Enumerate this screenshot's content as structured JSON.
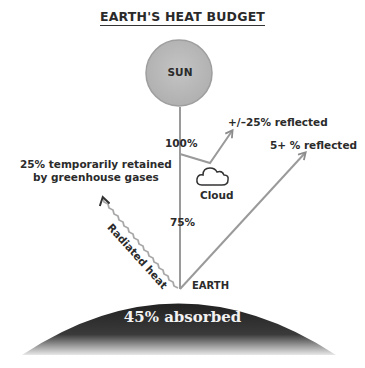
{
  "title": "EARTH'S HEAT BUDGET",
  "sun": {
    "label": "SUN",
    "color": "#bdbdbd"
  },
  "earth": {
    "label": "EARTH",
    "absorbed_label": "45% absorbed",
    "color": "#2e2e2e"
  },
  "cloud": {
    "label": "Cloud"
  },
  "rays": {
    "incoming_label": "100%",
    "after_cloud_label": "75%",
    "cloud_reflected_label": "+/–25% reflected",
    "surface_reflected_label": "5+ % reflected",
    "radiated_label": "Radiated heat",
    "retained_label_line1": "25% temporarily retained",
    "retained_label_line2": "by greenhouse gases",
    "line_color": "#9a9a9a"
  }
}
